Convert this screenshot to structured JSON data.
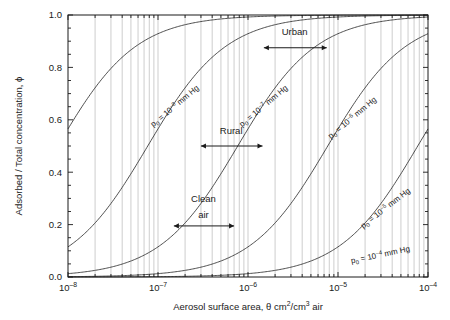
{
  "chart_data": {
    "type": "line",
    "title": "",
    "xlabel": "Aerosol surface area, θ cm2/cm3 air",
    "xlabel_parts": {
      "prefix": "Aerosol surface area, θ cm",
      "sup1": "2",
      "mid": "/cm",
      "sup2": "3",
      "suffix": " air"
    },
    "ylabel": "Adsorbed / Total concentration, ϕ",
    "xscale": "log",
    "yscale": "linear",
    "xlim": [
      1e-08,
      0.0001
    ],
    "ylim": [
      0.0,
      1.0
    ],
    "xticks": [
      1e-08,
      1e-07,
      1e-06,
      1e-05,
      0.0001
    ],
    "xtick_labels": [
      "10-8",
      "10-7",
      "10-6",
      "10-5",
      "10-4"
    ],
    "xtick_mantissa": "10",
    "xtick_exponents": [
      "–8",
      "–7",
      "–6",
      "–5",
      "–4"
    ],
    "yticks": [
      0.0,
      0.2,
      0.4,
      0.6,
      0.8,
      1.0
    ],
    "ytick_labels": [
      "0.0",
      "0.2",
      "0.4",
      "0.6",
      "0.8",
      "1.0"
    ],
    "yminor_step": 0.05,
    "grid": "vertical-log-minor",
    "grid_color": "#b8b8b8",
    "line_color": "#3a3a3a",
    "axis_color": "#1a1a1a",
    "legend_position": "inline-curve-labels",
    "series": [
      {
        "name": "p0 = 10-8 mm Hg",
        "label_prefix": "p",
        "label_sub": "0",
        "label_mid": " = 10",
        "label_sup": "–8",
        "label_suffix": " mm Hg",
        "p0": 1e-08,
        "K": 130000000.0,
        "label_x": 1.6e-07,
        "label_y": 0.645,
        "label_rot": -40,
        "points_x": [
          1e-08,
          2e-08,
          3e-08,
          5e-08,
          7e-08,
          1e-07,
          2e-07,
          3e-07,
          5e-07,
          1e-06,
          1e-05,
          0.0001
        ],
        "points_y": [
          0.115,
          0.21,
          0.28,
          0.4,
          0.48,
          0.57,
          0.72,
          0.8,
          0.87,
          0.93,
          0.99,
          1.0
        ]
      },
      {
        "name": "p0 = 10-7 mm Hg",
        "label_prefix": "p",
        "label_sub": "0",
        "label_mid": " = 10",
        "label_sup": "–7",
        "label_suffix": " mm Hg",
        "p0": 1e-07,
        "K": 13000000.0,
        "label_x": 1.55e-06,
        "label_y": 0.645,
        "label_rot": -40,
        "points_x": [
          1e-08,
          1e-07,
          2e-07,
          5e-07,
          1e-06,
          2e-06,
          5e-06,
          1e-05,
          0.0001
        ],
        "points_y": [
          0.015,
          0.115,
          0.21,
          0.4,
          0.57,
          0.72,
          0.87,
          0.93,
          0.99
        ]
      },
      {
        "name": "p0 = 10-6 mm Hg",
        "label_prefix": "p",
        "label_sub": "0",
        "label_mid": " = 10",
        "label_sup": "–6",
        "label_suffix": " mm Hg",
        "p0": 1e-06,
        "K": 1300000.0,
        "label_x": 1.5e-05,
        "label_y": 0.6,
        "label_rot": -40,
        "points_x": [
          1e-07,
          1e-06,
          2e-06,
          5e-06,
          1e-05,
          2e-05,
          5e-05,
          0.0001
        ],
        "points_y": [
          0.015,
          0.115,
          0.21,
          0.4,
          0.57,
          0.72,
          0.87,
          0.93
        ]
      },
      {
        "name": "p0 = 10-5 mm Hg",
        "label_prefix": "p",
        "label_sub": "0",
        "label_mid": " = 10",
        "label_sup": "–5",
        "label_suffix": " mm Hg",
        "p0": 1e-05,
        "K": 130000.0,
        "label_x": 3.5e-05,
        "label_y": 0.255,
        "label_rot": -38,
        "points_x": [
          1e-06,
          1e-05,
          2e-05,
          5e-05,
          0.0001
        ],
        "points_y": [
          0.015,
          0.115,
          0.21,
          0.4,
          0.57
        ]
      },
      {
        "name": "p0 = 10-4 mm Hg",
        "label_prefix": "p",
        "label_sub": "0",
        "label_mid": " = 10",
        "label_sup": "–4",
        "label_suffix": " mm Hg",
        "p0": 0.0001,
        "K": 13000.0,
        "label_x": 3e-05,
        "label_y": 0.075,
        "label_rot": -12,
        "points_x": [
          1e-08,
          1e-06,
          1e-05,
          5e-05,
          0.0001
        ],
        "points_y": [
          0.0,
          0.0015,
          0.015,
          0.065,
          0.115
        ]
      }
    ],
    "annotations": [
      {
        "text": "Clean",
        "text2": "air",
        "name": "clean-air",
        "label_x": 3.2e-07,
        "label_y": 0.285,
        "label2_y": 0.225,
        "arrow_y": 0.195,
        "arrow_x0": 1.5e-07,
        "arrow_x1": 7e-07
      },
      {
        "text": "Rural",
        "text2": "",
        "name": "rural",
        "label_x": 6.5e-07,
        "label_y": 0.545,
        "label2_y": 0.545,
        "arrow_y": 0.5,
        "arrow_x0": 3e-07,
        "arrow_x1": 1.45e-06
      },
      {
        "text": "Urban",
        "text2": "",
        "name": "urban",
        "label_x": 3.3e-06,
        "label_y": 0.925,
        "label2_y": 0.925,
        "arrow_y": 0.875,
        "arrow_x0": 1.5e-06,
        "arrow_x1": 7.5e-06
      }
    ]
  }
}
